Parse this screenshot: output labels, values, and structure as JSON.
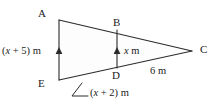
{
  "figure": {
    "type": "geometry-diagram",
    "stroke_color": "#2b2b2b",
    "fill_color": "#fdfdfd",
    "text_color": "#1b1b1b",
    "vertices": [
      {
        "id": "A",
        "label": "A",
        "x": 59,
        "y": 20
      },
      {
        "id": "B",
        "label": "B",
        "x": 117,
        "y": 30
      },
      {
        "id": "C",
        "label": "C",
        "x": 192,
        "y": 51
      },
      {
        "id": "D",
        "label": "D",
        "x": 117,
        "y": 68
      },
      {
        "id": "E",
        "label": "E",
        "x": 59,
        "y": 80
      }
    ],
    "measurements": {
      "left_side": "(x + 5) m",
      "middle_segment": "x m",
      "bottom_side": "(x + 2) m",
      "slant_side": "6 m"
    },
    "marks": {
      "parallel_marker": "arrowhead",
      "parallel_segments": [
        "AE",
        "BD"
      ]
    }
  }
}
